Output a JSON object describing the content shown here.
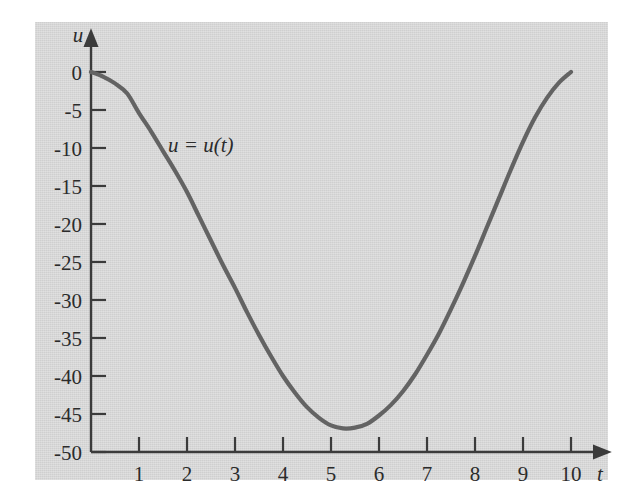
{
  "figure": {
    "background_color": "#ffffff",
    "panel_color": "#cfcfcf",
    "curve_color": "#636363",
    "axis_color": "#3b3b3b"
  },
  "chart_data": {
    "type": "line",
    "title": "",
    "subtitle": "",
    "xlabel": "t",
    "ylabel": "u",
    "xlim": [
      0,
      10.6
    ],
    "ylim": [
      -50,
      2
    ],
    "grid": false,
    "legend": "none",
    "annotations": [
      {
        "text": "u = u(t)",
        "x": 1.6,
        "y": -9.5
      }
    ],
    "xticks": [
      1,
      2,
      3,
      4,
      5,
      6,
      7,
      8,
      9,
      10
    ],
    "xticklabels": [
      "1",
      "2",
      "3",
      "4",
      "5",
      "6",
      "7",
      "8",
      "9",
      "10"
    ],
    "yticks": [
      0,
      -5,
      -10,
      -15,
      -20,
      -25,
      -30,
      -35,
      -40,
      -45,
      -50
    ],
    "yticklabels": [
      "0",
      "-5",
      "-10",
      "-15",
      "-20",
      "-25",
      "-30",
      "-35",
      "-40",
      "-45",
      "-50"
    ],
    "series": [
      {
        "name": "u = u(t)",
        "x": [
          0.0,
          0.25,
          0.5,
          0.75,
          1.0,
          1.25,
          1.5,
          1.75,
          2.0,
          2.25,
          2.5,
          2.75,
          3.0,
          3.25,
          3.5,
          3.75,
          4.0,
          4.25,
          4.5,
          4.75,
          5.0,
          5.25,
          5.5,
          5.75,
          6.0,
          6.25,
          6.5,
          6.75,
          7.0,
          7.25,
          7.5,
          7.75,
          8.0,
          8.25,
          8.5,
          8.75,
          9.0,
          9.25,
          9.5,
          9.75,
          10.0
        ],
        "y": [
          0.0,
          -0.6,
          -1.5,
          -2.8,
          -5.4,
          -7.8,
          -10.4,
          -13.0,
          -15.8,
          -19.0,
          -22.2,
          -25.4,
          -28.4,
          -31.6,
          -34.6,
          -37.4,
          -40.0,
          -42.2,
          -44.1,
          -45.5,
          -46.5,
          -46.9,
          -46.8,
          -46.3,
          -45.2,
          -43.8,
          -42.0,
          -39.8,
          -37.2,
          -34.4,
          -31.2,
          -27.8,
          -24.2,
          -20.4,
          -16.6,
          -12.8,
          -9.2,
          -6.0,
          -3.4,
          -1.4,
          0.0
        ]
      }
    ]
  }
}
